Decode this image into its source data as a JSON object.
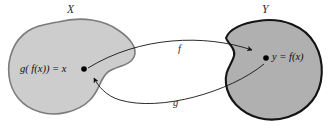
{
  "figure": {
    "background_color": "#ffffff"
  },
  "sets": {
    "domain": {
      "label": "X",
      "fill_color": "#cdcdcd",
      "stroke_color": "#7a7a7a"
    },
    "codomain": {
      "label": "Y",
      "fill_color": "#b0b0b0",
      "stroke_color": "#1a1a1a"
    }
  },
  "points": {
    "domain_point": {
      "label": "g( f(x)) = x",
      "color": "#000000"
    },
    "codomain_point": {
      "label": "y = f(x)",
      "color": "#000000"
    }
  },
  "arrows": {
    "forward": {
      "label": "f",
      "from": "domain_point",
      "to": "codomain_point",
      "color": "#1a1a1a"
    },
    "inverse": {
      "label": "g",
      "from": "codomain_point",
      "to": "domain_point",
      "color": "#1a1a1a"
    }
  }
}
